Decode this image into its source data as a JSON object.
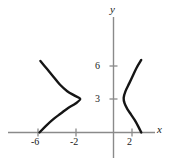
{
  "figure": {
    "axis_labels": {
      "x": "x",
      "y": "y"
    },
    "colors": {
      "curve": "#151515",
      "axis": "#8a8a8a",
      "tick_text": "#1a1a1a",
      "background": "#ffffff"
    }
  },
  "chart_data": {
    "type": "line",
    "title": "",
    "xlabel": "x",
    "ylabel": "y",
    "grid": false,
    "legend": null,
    "xlim": [
      -8.1,
      3.1
    ],
    "ylim": [
      -0.6,
      7.6
    ],
    "xticks": [
      -6,
      -2,
      2
    ],
    "xtick_labels": [
      "-6",
      "-2",
      "2"
    ],
    "yticks": [
      3,
      6
    ],
    "ytick_labels": [
      "3",
      "6"
    ],
    "series": [
      {
        "name": "left-branch",
        "comment": "opens to the left; vertex near x = -3.5 at y = 3",
        "points": [
          [
            -7.9,
            6.4
          ],
          [
            -7.2,
            5.7
          ],
          [
            -6.5,
            5.0
          ],
          [
            -5.8,
            4.3
          ],
          [
            -5.0,
            3.7
          ],
          [
            -4.2,
            3.3
          ],
          [
            -3.6,
            3.0
          ],
          [
            -4.1,
            2.6
          ],
          [
            -4.9,
            2.2
          ],
          [
            -5.7,
            1.7
          ],
          [
            -6.5,
            1.2
          ],
          [
            -7.3,
            0.6
          ],
          [
            -8.0,
            0.0
          ]
        ]
      },
      {
        "name": "right-branch",
        "comment": "opens to the right; vertex near x = 1.1 at y = 3",
        "points": [
          [
            3.0,
            6.5
          ],
          [
            2.5,
            5.8
          ],
          [
            2.1,
            5.1
          ],
          [
            1.7,
            4.4
          ],
          [
            1.3,
            3.7
          ],
          [
            1.1,
            3.1
          ],
          [
            1.2,
            2.6
          ],
          [
            1.5,
            2.1
          ],
          [
            1.9,
            1.6
          ],
          [
            2.3,
            1.1
          ],
          [
            2.7,
            0.5
          ],
          [
            3.0,
            0.0
          ]
        ]
      }
    ]
  }
}
